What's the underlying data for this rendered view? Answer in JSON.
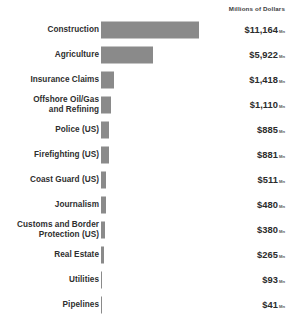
{
  "header": {
    "clipped_title": "",
    "unit_header": "Millions of Dollars"
  },
  "chart_data": {
    "type": "bar",
    "orientation": "horizontal",
    "title": "",
    "subtitle": "",
    "xlabel": "",
    "ylabel": "",
    "unit_label": "Millions of Dollars",
    "value_prefix": "$",
    "value_suffix": "Mn",
    "grid": false,
    "legend": false,
    "axis_visible": false,
    "bar_color": "#8a8a8a",
    "label_color": "#2e2e2e",
    "background": "#ffffff",
    "xlim": [
      0,
      11164
    ],
    "categories": [
      "Construction",
      "Agriculture",
      "Insurance Claims",
      "Offshore Oil/Gas and Refining",
      "Police (US)",
      "Firefighting (US)",
      "Coast Guard (US)",
      "Journalism",
      "Customs and Border Protection (US)",
      "Real Estate",
      "Utilities",
      "Pipelines"
    ],
    "values": [
      11164,
      5922,
      1418,
      1110,
      885,
      881,
      511,
      480,
      380,
      265,
      93,
      41
    ],
    "value_labels": [
      "$11,164",
      "$5,922",
      "$1,418",
      "$1,110",
      "$885",
      "$881",
      "$511",
      "$480",
      "$380",
      "$265",
      "$93",
      "$41"
    ]
  },
  "rows": [
    {
      "label_line1": "Construction",
      "label_line2": "",
      "value": "$11,164",
      "suffix": "Mn",
      "bar_px": 98
    },
    {
      "label_line1": "Agriculture",
      "label_line2": "",
      "value": "$5,922",
      "suffix": "Mn",
      "bar_px": 52
    },
    {
      "label_line1": "Insurance Claims",
      "label_line2": "",
      "value": "$1,418",
      "suffix": "Mn",
      "bar_px": 13
    },
    {
      "label_line1": "Offshore Oil/Gas",
      "label_line2": "and Refining",
      "value": "$1,110",
      "suffix": "Mn",
      "bar_px": 10
    },
    {
      "label_line1": "Police (US)",
      "label_line2": "",
      "value": "$885",
      "suffix": "Mn",
      "bar_px": 8
    },
    {
      "label_line1": "Firefighting (US)",
      "label_line2": "",
      "value": "$881",
      "suffix": "Mn",
      "bar_px": 8
    },
    {
      "label_line1": "Coast Guard (US)",
      "label_line2": "",
      "value": "$511",
      "suffix": "Mn",
      "bar_px": 5
    },
    {
      "label_line1": "Journalism",
      "label_line2": "",
      "value": "$480",
      "suffix": "Mn",
      "bar_px": 4.5
    },
    {
      "label_line1": "Customs and Border",
      "label_line2": "Protection (US)",
      "value": "$380",
      "suffix": "Mn",
      "bar_px": 3.5
    },
    {
      "label_line1": "Real Estate",
      "label_line2": "",
      "value": "$265",
      "suffix": "Mn",
      "bar_px": 2.5
    },
    {
      "label_line1": "Utilities",
      "label_line2": "",
      "value": "$93",
      "suffix": "Mn",
      "bar_px": 0.9
    },
    {
      "label_line1": "Pipelines",
      "label_line2": "",
      "value": "$41",
      "suffix": "Mn",
      "bar_px": 0.4
    }
  ]
}
